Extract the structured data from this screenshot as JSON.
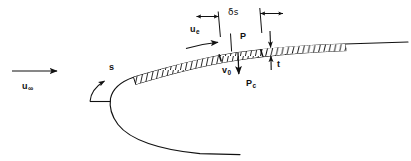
{
  "figure": {
    "stroke_color": "#111111",
    "background_color": "#ffffff",
    "width": 411,
    "height": 161
  },
  "labels": {
    "freestream_velocity": "u",
    "freestream_subscript": "∞",
    "arc_coordinate": "s",
    "edge_velocity": "u",
    "edge_subscript": "e",
    "element_length": "δs",
    "surface_pressure": "P",
    "blowing_velocity": "v",
    "blowing_subscript": "0",
    "chamber_pressure": "P",
    "chamber_subscript": "c",
    "wall_thickness": "t"
  },
  "annotations": [
    {
      "name": "freestream-arrow",
      "label": "u∞",
      "meaning": "freestream velocity arrow pointing right"
    },
    {
      "name": "arc-length-arrow",
      "label": "s",
      "meaning": "curved arrow for surface arc-length coordinate"
    },
    {
      "name": "edge-velocity-arrow",
      "label": "ue",
      "meaning": "boundary-layer edge velocity arrow along the surface"
    },
    {
      "name": "element-length-dimension",
      "label": "δs",
      "meaning": "dimension of surface element"
    },
    {
      "name": "surface-pressure-label",
      "label": "P",
      "meaning": "surface pressure acting on element"
    },
    {
      "name": "blowing-velocity-arrow",
      "label": "v0",
      "meaning": "injection/blowing velocity arrow into the surface"
    },
    {
      "name": "chamber-pressure-label",
      "label": "Pc",
      "meaning": "chamber pressure beneath the wall"
    },
    {
      "name": "wall-thickness-dimension",
      "label": "t",
      "meaning": "wall thickness dimension"
    }
  ]
}
